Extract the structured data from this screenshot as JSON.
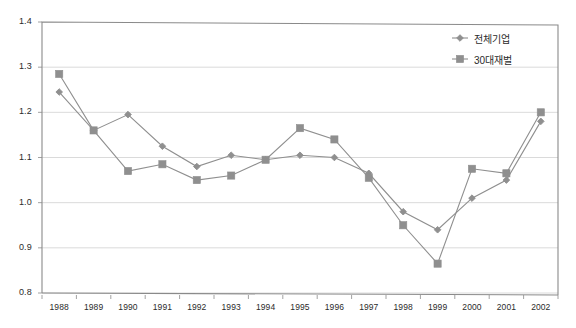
{
  "chart_data": {
    "type": "line",
    "title": "",
    "xlabel": "",
    "ylabel": "",
    "ylim": [
      0.8,
      1.4
    ],
    "ytick_step": 0.1,
    "grid": true,
    "legend_position": "top-right",
    "categories": [
      "1988",
      "1989",
      "1990",
      "1991",
      "1992",
      "1993",
      "1994",
      "1995",
      "1996",
      "1997",
      "1998",
      "1999",
      "2000",
      "2001",
      "2002"
    ],
    "yticks": [
      "0.8",
      "0.9",
      "1.0",
      "1.1",
      "1.2",
      "1.3",
      "1.4"
    ],
    "series": [
      {
        "name": "전체기업",
        "marker": "diamond",
        "color": "#8f8f8f",
        "values": [
          1.245,
          1.16,
          1.195,
          1.125,
          1.08,
          1.105,
          1.095,
          1.105,
          1.1,
          1.065,
          0.98,
          0.94,
          1.01,
          1.05,
          1.18
        ]
      },
      {
        "name": "30대재벌",
        "marker": "square",
        "color": "#8f8f8f",
        "values": [
          1.285,
          1.16,
          1.07,
          1.085,
          1.05,
          1.06,
          1.095,
          1.165,
          1.14,
          1.055,
          0.95,
          0.865,
          1.075,
          1.065,
          1.2
        ]
      }
    ]
  },
  "legend": {
    "items": [
      {
        "label": "전체기업"
      },
      {
        "label": "30대재벌"
      }
    ]
  },
  "colors": {
    "series": "#8f8f8f",
    "grid": "#d0d0d0",
    "axis": "#8a8a8a",
    "text": "#2b2b2b"
  }
}
